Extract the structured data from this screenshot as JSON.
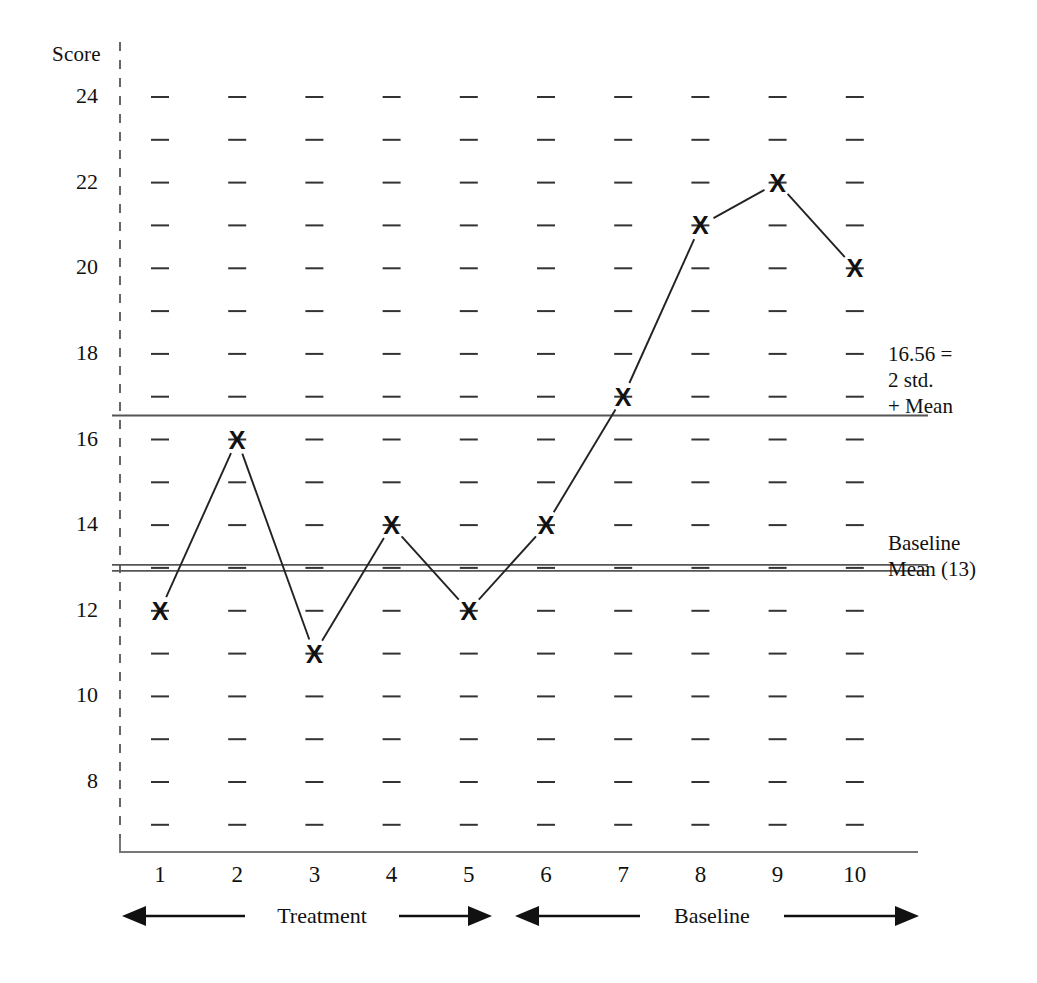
{
  "chart_data": {
    "type": "line",
    "title": "",
    "xlabel": "",
    "ylabel": "Score",
    "x": [
      1,
      2,
      3,
      4,
      5,
      6,
      7,
      8,
      9,
      10
    ],
    "values": [
      12,
      16,
      11,
      14,
      12,
      14,
      17,
      21,
      22,
      20
    ],
    "series": [
      {
        "name": "Score",
        "marker": "X",
        "values": [
          12,
          16,
          11,
          14,
          12,
          14,
          17,
          21,
          22,
          20
        ]
      }
    ],
    "xticklabels": [
      "1",
      "2",
      "3",
      "4",
      "5",
      "6",
      "7",
      "8",
      "9",
      "10"
    ],
    "yticklabels": [
      "24",
      "22",
      "20",
      "18",
      "16",
      "14",
      "12",
      "10",
      "8"
    ],
    "ytickvalues": [
      24,
      22,
      20,
      18,
      16,
      14,
      12,
      10,
      8
    ],
    "ylim": [
      6,
      25
    ],
    "xlim": [
      0.5,
      10.5
    ],
    "grid": "dashed-tick-marks",
    "legend": "none",
    "reference_lines": [
      {
        "name": "two-std-above-mean",
        "value": 16.56,
        "style": "single",
        "label_lines": [
          "16.56 =",
          "2 std.",
          "+ Mean"
        ]
      },
      {
        "name": "baseline-mean",
        "value": 13,
        "style": "double",
        "label_lines": [
          "Baseline",
          "Mean (13)"
        ]
      }
    ],
    "phases": [
      {
        "name": "treatment",
        "label": "Treatment",
        "from": 1,
        "to": 5
      },
      {
        "name": "baseline",
        "label": "Baseline",
        "from": 6,
        "to": 10
      }
    ],
    "colors": {
      "ink": "#111111",
      "line": "#222222",
      "axis": "#555555",
      "grid": "#333333",
      "background": "#ffffff"
    }
  },
  "axis": {
    "y_title": "Score",
    "y_ticks": [
      "24",
      "22",
      "20",
      "18",
      "16",
      "14",
      "12",
      "10",
      "8"
    ],
    "x_ticks": [
      "1",
      "2",
      "3",
      "4",
      "5",
      "6",
      "7",
      "8",
      "9",
      "10"
    ]
  },
  "annotations": {
    "upper_line": {
      "line1": "16.56 =",
      "line2": "2 std.",
      "line3": "+ Mean"
    },
    "mean_line": {
      "line1": "Baseline",
      "line2": "Mean (13)"
    }
  },
  "phases": {
    "treatment_label": "Treatment",
    "baseline_label": "Baseline"
  },
  "markers": {
    "glyph": "X"
  }
}
